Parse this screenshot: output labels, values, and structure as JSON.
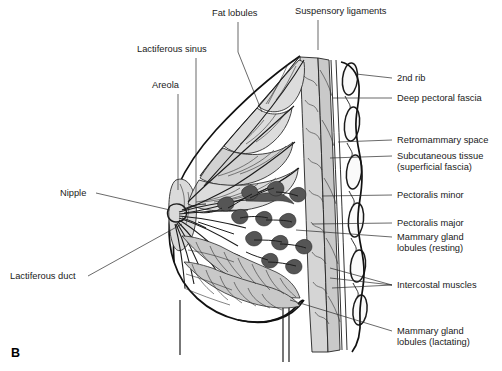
{
  "figure": {
    "panel_label": "B",
    "background_color": "#ffffff",
    "ink_color": "#1a1a1a",
    "fat_fill_color": "#dcdcdc",
    "gland_fill_color": "#c8c8c8",
    "chest_wall_fill_color": "#d5d5d5"
  },
  "labels": {
    "top": [
      {
        "id": "fat-lobules",
        "text": "Fat lobules",
        "x": 212,
        "y": 16
      },
      {
        "id": "suspensory-ligaments",
        "text": "Suspensory ligaments",
        "x": 295,
        "y": 14
      }
    ],
    "left": [
      {
        "id": "lactiferous-sinus",
        "text": "Lactiferous sinus",
        "x": 137,
        "y": 52
      },
      {
        "id": "areola",
        "text": "Areola",
        "x": 152,
        "y": 88
      },
      {
        "id": "nipple",
        "text": "Nipple",
        "x": 60,
        "y": 196
      },
      {
        "id": "lactiferous-duct",
        "text": "Lactiferous duct",
        "x": 10,
        "y": 279
      }
    ],
    "right": [
      {
        "id": "second-rib",
        "text": "2nd rib",
        "x": 397,
        "y": 81
      },
      {
        "id": "deep-pectoral-fascia",
        "text": "Deep pectoral fascia",
        "x": 397,
        "y": 101
      },
      {
        "id": "retromammary-space",
        "text": "Retromammary space",
        "x": 397,
        "y": 143
      },
      {
        "id": "subcutaneous-tissue",
        "text": "Subcutaneous tissue",
        "x": 397,
        "y": 159
      },
      {
        "id": "superficial-fascia",
        "text": "(superficial fascia)",
        "x": 397,
        "y": 170
      },
      {
        "id": "pectoralis-minor",
        "text": "Pectoralis minor",
        "x": 397,
        "y": 198
      },
      {
        "id": "pectoralis-major",
        "text": "Pectoralis major",
        "x": 397,
        "y": 226
      },
      {
        "id": "mammary-gland-resting-1",
        "text": "Mammary gland",
        "x": 397,
        "y": 240
      },
      {
        "id": "mammary-gland-resting-2",
        "text": "lobules (resting)",
        "x": 397,
        "y": 251
      },
      {
        "id": "intercostal-muscles",
        "text": "Intercostal muscles",
        "x": 397,
        "y": 288
      },
      {
        "id": "mammary-gland-lactating-1",
        "text": "Mammary gland",
        "x": 397,
        "y": 334
      },
      {
        "id": "mammary-gland-lactating-2",
        "text": "lobules (lactating)",
        "x": 397,
        "y": 345
      }
    ]
  }
}
